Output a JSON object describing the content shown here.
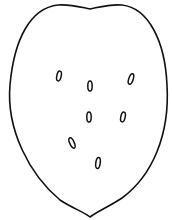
{
  "figure": {
    "stroke_color": "#111111",
    "background": "#ffffff",
    "outline_path": "M 90 9 C 80 7 70 4 58 5 C 30 8 14 40 10 85 C 6 130 30 175 60 200 C 72 208 84 212 90 217 C 98 211 110 206 122 198 C 152 176 170 135 167 85 C 165 40 148 8 122 5 C 110 4 100 7 90 9 Z",
    "seeds": [
      {
        "cx": 59,
        "cy": 76,
        "rx": 2.2,
        "ry": 5,
        "rot": 12
      },
      {
        "cx": 90,
        "cy": 86,
        "rx": 2.2,
        "ry": 5,
        "rot": 0
      },
      {
        "cx": 131,
        "cy": 79,
        "rx": 2.2,
        "ry": 5.5,
        "rot": 18
      },
      {
        "cx": 89,
        "cy": 117,
        "rx": 2.2,
        "ry": 5,
        "rot": 0
      },
      {
        "cx": 123,
        "cy": 117,
        "rx": 2.2,
        "ry": 5,
        "rot": 12
      },
      {
        "cx": 72,
        "cy": 143,
        "rx": 2.2,
        "ry": 5.5,
        "rot": -25
      },
      {
        "cx": 98,
        "cy": 163,
        "rx": 2.2,
        "ry": 5.5,
        "rot": 8
      }
    ]
  }
}
